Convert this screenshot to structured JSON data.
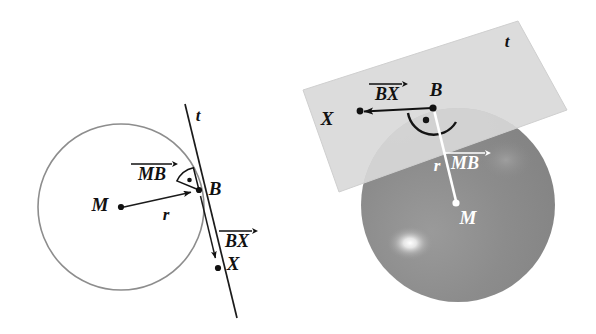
{
  "figure": {
    "background_color": "#ffffff",
    "panels": [
      {
        "id": "panel-2d",
        "name": "circle-tangent-line-2d",
        "caption": "",
        "labels": {
          "center": "M",
          "tangent_point": "B",
          "far_point": "X",
          "radius": "r",
          "tangent_line": "t",
          "vector_mb": "MB",
          "vector_bx": "BX"
        }
      },
      {
        "id": "panel-3d",
        "name": "sphere-tangent-plane-3d",
        "caption": "",
        "labels": {
          "center": "M",
          "tangent_point": "B",
          "far_point": "X",
          "radius": "r",
          "tangent_plane": "t",
          "vector_mb": "MB",
          "vector_bx": "BX"
        }
      }
    ],
    "colors": {
      "ink": "#111111",
      "circle_stroke": "#8d8d8d",
      "plane_fill": "#d6d6d6",
      "plane_fill_shadow": "#c9c9c9",
      "sphere_front": "#8a8a8a",
      "sphere_behind_plane": "#b2b2b2",
      "sphere_highlight": "#fdfdfd",
      "white_ink": "#ffffff"
    },
    "geometry_2d": {
      "circle_center": [
        121,
        207
      ],
      "circle_radius": 83,
      "point_M": [
        121,
        207
      ],
      "point_B": [
        199,
        190
      ],
      "point_X": [
        218,
        268
      ],
      "tangent_line_from": [
        185,
        104
      ],
      "tangent_line_to": [
        237,
        318
      ],
      "right_angle_marker": "filled-arc-with-dot"
    },
    "geometry_3d": {
      "sphere_center": [
        160,
        205
      ],
      "sphere_radius": 97,
      "point_M": [
        158,
        203
      ],
      "point_B": [
        135,
        108
      ],
      "point_X": [
        62,
        112
      ],
      "plane_corners": [
        [
          220,
          21
        ],
        [
          269,
          110
        ],
        [
          41,
          192
        ],
        [
          5,
          90
        ]
      ],
      "highlight_center": [
        112,
        243
      ],
      "angle_marker": "180-degree-arc-with-dot"
    }
  }
}
